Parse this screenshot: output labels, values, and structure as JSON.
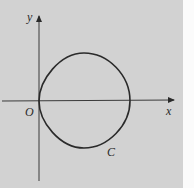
{
  "diagram": {
    "type": "coordinate-plane-curve",
    "labels": {
      "y_axis": "y",
      "x_axis": "x",
      "origin": "O",
      "curve": "C"
    },
    "colors": {
      "background": "#d2d2d2",
      "margin": "#fbfbfb",
      "stroke": "#2a2a2a"
    },
    "curve_description": "Closed rounded-square-like curve passing through origin O, lying mostly in quadrants I and IV, labeled C"
  }
}
